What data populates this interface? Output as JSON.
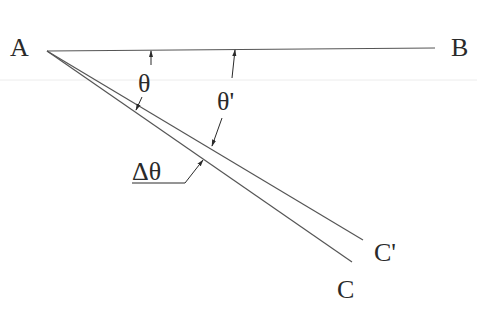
{
  "diagram": {
    "type": "angle-geometry",
    "labels": {
      "point_a": "A",
      "point_b": "B",
      "point_c": "C",
      "point_c_prime": "C'",
      "theta": "θ",
      "theta_prime": "θ'",
      "delta_theta": "Δθ"
    },
    "colors": {
      "line": "#555555",
      "text": "#2a2a2a",
      "faint_rule": "#ececec"
    },
    "points": {
      "A": [
        47,
        51
      ],
      "B_end": [
        435,
        48
      ],
      "C_end": [
        352,
        262
      ],
      "C_prime_end": [
        363,
        240
      ]
    }
  }
}
